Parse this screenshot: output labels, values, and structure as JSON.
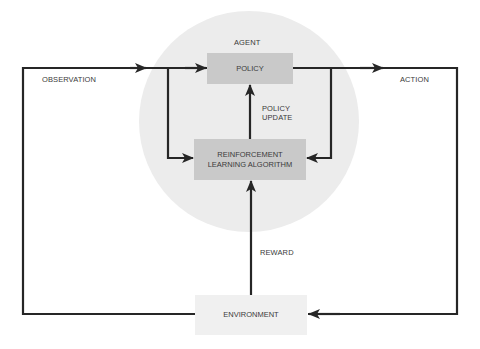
{
  "diagram": {
    "agent": {
      "label": "AGENT",
      "policy_box": "POLICY",
      "rl_box_line1": "REINFORCEMENT",
      "rl_box_line2": "LEARNING ALGORITHM",
      "policy_update_line1": "POLICY",
      "policy_update_line2": "UPDATE"
    },
    "environment_box": "ENVIRONMENT",
    "edges": {
      "observation": "OBSERVATION",
      "action": "ACTION",
      "reward": "REWARD"
    },
    "colors": {
      "line": "#262626",
      "agent_circle": "#ececec",
      "agent_box": "#c9c9c9",
      "environment_box": "#f0f0f0",
      "text": "#3a3a3a"
    }
  }
}
